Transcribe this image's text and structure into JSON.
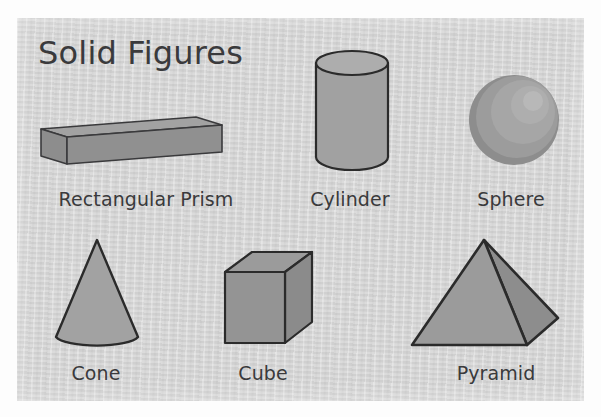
{
  "poster": {
    "title": "Solid Figures",
    "background_color": "#fdfdfd",
    "card_color": "#d3d3d3",
    "text_color": "#3a3a3c",
    "shape_fill": "#9a9a9a",
    "shape_fill_dark": "#7e7e7e",
    "shape_fill_light": "#b0b0b0",
    "shape_outline": "#2b2b2b"
  },
  "figures": [
    {
      "id": "rectangular-prism",
      "icon": "rectangular-prism-icon",
      "label": "Rectangular Prism",
      "row": 1,
      "column": 1,
      "label_center_x": 146,
      "label_baseline_y": 206
    },
    {
      "id": "cylinder",
      "icon": "cylinder-icon",
      "label": "Cylinder",
      "row": 1,
      "column": 2,
      "label_center_x": 350,
      "label_baseline_y": 206
    },
    {
      "id": "sphere",
      "icon": "sphere-icon",
      "label": "Sphere",
      "row": 1,
      "column": 3,
      "label_center_x": 511,
      "label_baseline_y": 206
    },
    {
      "id": "cone",
      "icon": "cone-icon",
      "label": "Cone",
      "row": 2,
      "column": 1,
      "label_center_x": 96,
      "label_baseline_y": 380
    },
    {
      "id": "cube",
      "icon": "cube-icon",
      "label": "Cube",
      "row": 2,
      "column": 2,
      "label_center_x": 263,
      "label_baseline_y": 380
    },
    {
      "id": "pyramid",
      "icon": "pyramid-icon",
      "label": "Pyramid",
      "row": 2,
      "column": 3,
      "label_center_x": 496,
      "label_baseline_y": 380
    }
  ]
}
